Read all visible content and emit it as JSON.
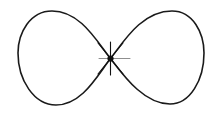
{
  "figure": {
    "background_color": "#ffffff",
    "width": 221,
    "height": 118,
    "curve": {
      "name": "lemniscate-curve",
      "stroke_color": "#1a1a1a",
      "stroke_width": 1.6,
      "fill": "none",
      "description": "Closed figure-eight / bowtie curve self-intersecting at a single node",
      "node_point": {
        "x": 110.5,
        "y": 58.5
      },
      "bounds": {
        "left": 18,
        "right": 204,
        "top": 10,
        "bottom": 106
      },
      "left_lobe": {
        "name": "left-lobe",
        "apex_top": {
          "x": 52,
          "y": 11
        },
        "apex_bottom": {
          "x": 55,
          "y": 105
        },
        "extreme_left": {
          "x": 18,
          "y": 58
        }
      },
      "right_lobe": {
        "name": "right-lobe",
        "apex_top": {
          "x": 181,
          "y": 11
        },
        "apex_bottom": {
          "x": 176,
          "y": 104
        },
        "extreme_right": {
          "x": 204,
          "y": 58
        }
      },
      "path": "M 110.5 58.5 C 96 40 80 11 52 11 C 30 11 18 33 18 53 C 18 80 34 105 56 105 C 82 105 97 76 110.5 58.5 C 124 41 142 11 172 11 C 193 11 204 33 204 53 C 204 80 190 104 170 104 C 144 104 124 76 110.5 58.5 Z"
    },
    "node_marker": {
      "name": "center-node-asterisk",
      "type": "asterisk-marker",
      "color": "#111111",
      "center": {
        "x": 110.5,
        "y": 58.5
      },
      "dot_radius": 3.1,
      "vertical_tick": {
        "x": 110.5,
        "y1": 42,
        "y2": 75,
        "stroke_width": 1.1
      },
      "diagonal_tick_1": {
        "x1": 98,
        "y1": 43,
        "x2": 123,
        "y2": 74,
        "stroke_width": 1.1
      },
      "diagonal_tick_2": {
        "x1": 98,
        "y1": 74,
        "x2": 123,
        "y2": 43,
        "stroke_width": 1.1
      }
    },
    "horizontal_tick": {
      "name": "center-horizontal-tick",
      "color": "#8f8f8f",
      "x1": 99,
      "x2": 130,
      "y": 58.5,
      "stroke_width": 1.0
    }
  }
}
